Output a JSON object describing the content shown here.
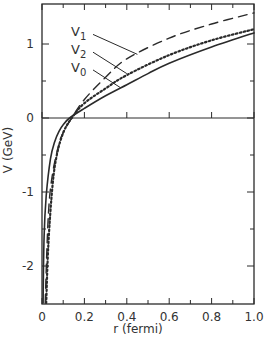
{
  "chart_data": {
    "type": "line",
    "title": "",
    "xlabel": "r (fermi)",
    "ylabel": "V (GeV)",
    "xlim": [
      0,
      1.0
    ],
    "ylim": [
      -2.5,
      1.54
    ],
    "grid": false,
    "legend_position": "inline labels with leader lines (upper left)",
    "x_ticks": [
      0,
      0.2,
      0.4,
      0.6,
      0.8,
      1.0
    ],
    "x_tick_labels": [
      "0",
      "0.2",
      "0.4",
      "0.6",
      "0.8",
      "1.0"
    ],
    "x_minor_ticks": [
      0.1,
      0.3,
      0.5,
      0.7,
      0.9
    ],
    "y_ticks": [
      -2,
      -1,
      0,
      1
    ],
    "y_tick_labels": [
      "-2",
      "-1",
      "0",
      "1"
    ],
    "y_minor_ticks": [
      -1.5,
      -0.5,
      0.5
    ],
    "reference_line": {
      "y": 0,
      "style": "solid"
    },
    "series": [
      {
        "name": "V0",
        "label_main": "V",
        "label_sub": "0",
        "style": "solid",
        "x": [
          0.005,
          0.01,
          0.02,
          0.04,
          0.06,
          0.08,
          0.1,
          0.13,
          0.2,
          0.3,
          0.4,
          0.5,
          0.6,
          0.8,
          1.0
        ],
        "values": [
          -2.5,
          -1.6,
          -1.05,
          -0.55,
          -0.32,
          -0.18,
          -0.09,
          0.0,
          0.13,
          0.3,
          0.45,
          0.6,
          0.74,
          0.96,
          1.15
        ]
      },
      {
        "name": "V1",
        "label_main": "V",
        "label_sub": "1",
        "style": "dashed",
        "x": [
          0.015,
          0.03,
          0.05,
          0.08,
          0.1,
          0.14,
          0.2,
          0.3,
          0.4,
          0.6,
          0.8,
          1.0
        ],
        "values": [
          -2.5,
          -1.3,
          -0.75,
          -0.35,
          -0.2,
          0.0,
          0.25,
          0.55,
          0.8,
          1.08,
          1.27,
          1.42
        ]
      },
      {
        "name": "V2",
        "label_main": "V",
        "label_sub": "2",
        "style": "dotted",
        "x": [
          0.02,
          0.03,
          0.05,
          0.07,
          0.1,
          0.14,
          0.2,
          0.3,
          0.4,
          0.6,
          0.8,
          1.0
        ],
        "values": [
          -2.5,
          -1.7,
          -0.9,
          -0.5,
          -0.2,
          0.0,
          0.2,
          0.4,
          0.58,
          0.85,
          1.05,
          1.2
        ]
      }
    ],
    "annotations": [
      {
        "text": "V1",
        "label_x": 0.25,
        "label_y": 1.17,
        "points_to": {
          "x": 0.45,
          "y": 0.86
        }
      },
      {
        "text": "V2",
        "label_x": 0.25,
        "label_y": 0.93,
        "points_to": {
          "x": 0.4,
          "y": 0.6
        }
      },
      {
        "text": "V0",
        "label_x": 0.25,
        "label_y": 0.69,
        "points_to": {
          "x": 0.37,
          "y": 0.41
        }
      }
    ]
  }
}
